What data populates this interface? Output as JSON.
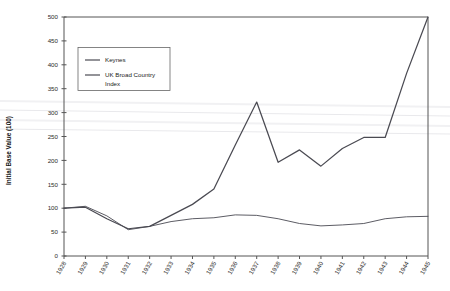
{
  "chart_data": {
    "type": "line",
    "title": "",
    "xlabel": "",
    "ylabel": "Initial Base Value (100)",
    "ylim": [
      0,
      500
    ],
    "yticks": [
      0,
      50,
      100,
      150,
      200,
      250,
      300,
      350,
      400,
      450,
      500
    ],
    "grid": false,
    "legend_position": "upper-left",
    "categories": [
      "1928",
      "1929",
      "1930",
      "1931",
      "1932",
      "1933",
      "1934",
      "1935",
      "1936",
      "1937",
      "1938",
      "1939",
      "1940",
      "1941",
      "1942",
      "1943",
      "1944",
      "1945"
    ],
    "series": [
      {
        "name": "Keynes",
        "color": "#4a4a52",
        "values": [
          100,
          102,
          78,
          57,
          62,
          85,
          108,
          140,
          232,
          322,
          196,
          222,
          188,
          225,
          248,
          248,
          382,
          500
        ]
      },
      {
        "name": "UK Broad Country Index",
        "color": "#4a4a52",
        "values": [
          100,
          104,
          84,
          55,
          62,
          72,
          78,
          80,
          86,
          85,
          78,
          68,
          63,
          65,
          68,
          78,
          82,
          83
        ]
      }
    ]
  },
  "legend": {
    "entries": [
      {
        "label": "Keynes"
      },
      {
        "label": "UK Broad Country",
        "label2": "Index"
      }
    ]
  },
  "axes": {
    "y_title": "Initial Base Value (100)"
  }
}
